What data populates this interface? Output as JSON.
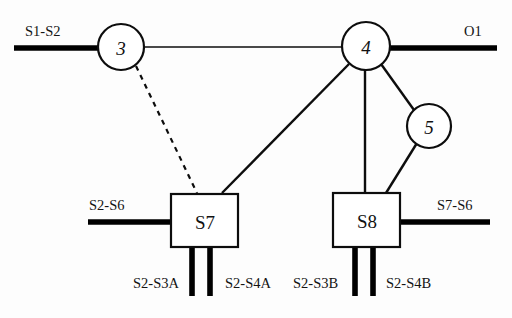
{
  "diagram": {
    "background_color": "#fdfdfd",
    "stroke_color": "#0d0d0d",
    "nodes": [
      {
        "id": "n3",
        "label": "3",
        "shape": "circle",
        "cx": 121,
        "cy": 47,
        "r": 23
      },
      {
        "id": "n4",
        "label": "4",
        "shape": "circle",
        "cx": 366,
        "cy": 46,
        "r": 24
      },
      {
        "id": "n5",
        "label": "5",
        "shape": "circle",
        "cx": 429,
        "cy": 126,
        "r": 22
      },
      {
        "id": "s7",
        "label": "S7",
        "shape": "box",
        "x": 171,
        "y": 194,
        "w": 67,
        "h": 53
      },
      {
        "id": "s8",
        "label": "S8",
        "shape": "box",
        "x": 333,
        "y": 193,
        "w": 67,
        "h": 54
      }
    ],
    "links": [
      {
        "id": "l-3-4",
        "from": "n3",
        "to": "n4",
        "style": "thin"
      },
      {
        "id": "l-3-s7",
        "from": "n3",
        "to": "s7",
        "style": "dashed"
      },
      {
        "id": "l-4-s7",
        "from": "n4",
        "to": "s7",
        "style": "solid"
      },
      {
        "id": "l-4-s8",
        "from": "n4",
        "to": "s8",
        "style": "solid"
      },
      {
        "id": "l-4-5",
        "from": "n4",
        "to": "n5",
        "style": "solid"
      },
      {
        "id": "l-5-s8",
        "from": "n5",
        "to": "s8",
        "style": "solid"
      }
    ],
    "terminals": [
      {
        "id": "t-s1-s2",
        "label": "S1-S2",
        "attached_to": "n3",
        "side": "left",
        "label_x": 25,
        "label_y": 36
      },
      {
        "id": "t-o1",
        "label": "O1",
        "attached_to": "n4",
        "side": "right",
        "label_x": 464,
        "label_y": 36
      },
      {
        "id": "t-s2-s6",
        "label": "S2-S6",
        "attached_to": "s7",
        "side": "left",
        "label_x": 89,
        "label_y": 210
      },
      {
        "id": "t-s7-s6",
        "label": "S7-S6",
        "attached_to": "s8",
        "side": "right",
        "label_x": 437,
        "label_y": 210
      },
      {
        "id": "t-s2-s3a",
        "label": "S2-S3A",
        "attached_to": "s7",
        "side": "bottom",
        "label_x": 133,
        "label_y": 288
      },
      {
        "id": "t-s2-s4a",
        "label": "S2-S4A",
        "attached_to": "s7",
        "side": "bottom",
        "label_x": 225,
        "label_y": 288
      },
      {
        "id": "t-s2-s3b",
        "label": "S2-S3B",
        "attached_to": "s8",
        "side": "bottom",
        "label_x": 293,
        "label_y": 288
      },
      {
        "id": "t-s2-s4b",
        "label": "S2-S4B",
        "attached_to": "s8",
        "side": "bottom",
        "label_x": 386,
        "label_y": 288
      }
    ]
  }
}
